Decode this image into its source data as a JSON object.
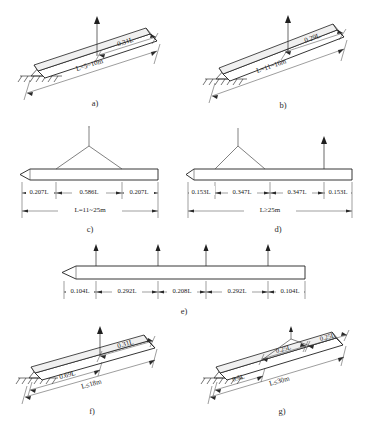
{
  "figure": {
    "caption_bottom": "",
    "panels": [
      {
        "id": "a",
        "label": "a)",
        "type": "inclined-single-point",
        "span_label": "L=5~10m",
        "segments": [
          "0.31L"
        ],
        "lift_points": 1,
        "ground_support": true,
        "sling": false
      },
      {
        "id": "b",
        "label": "b)",
        "type": "inclined-single-point",
        "span_label": "L=11~16m",
        "segments": [
          "0.29L"
        ],
        "lift_points": 1,
        "ground_support": true,
        "sling": false
      },
      {
        "id": "c",
        "label": "c)",
        "type": "horizontal-two-point-sling",
        "span_label": "L=11~25m",
        "segments": [
          "0.207L",
          "0.586L",
          "0.207L"
        ],
        "lift_points": 2,
        "ground_support": false,
        "sling": true
      },
      {
        "id": "d",
        "label": "d)",
        "type": "horizontal-three-point",
        "span_label": "L≥25m",
        "segments": [
          "0.153L",
          "0.347L",
          "0.347L",
          "0.153L"
        ],
        "lift_points": 3,
        "ground_support": false,
        "sling": true
      },
      {
        "id": "e",
        "label": "e)",
        "type": "horizontal-four-point",
        "span_label": "",
        "segments": [
          "0.104L",
          "0.292L",
          "0.208L",
          "0.292L",
          "0.104L"
        ],
        "lift_points": 4,
        "ground_support": false,
        "sling": false
      },
      {
        "id": "f",
        "label": "f)",
        "type": "inclined-single-point",
        "span_label": "L≤18m",
        "segments": [
          "0.69L",
          "0.31L"
        ],
        "lift_points": 1,
        "ground_support": true,
        "sling": false
      },
      {
        "id": "g",
        "label": "g)",
        "type": "inclined-two-point-sling",
        "span_label": "L≤30m",
        "segments": [
          "0.5L",
          "0.25L",
          "0.25L"
        ],
        "lift_points": 2,
        "ground_support": true,
        "sling": true
      }
    ],
    "colors": {
      "line": "#1f1f1f",
      "beam_face": "#ffffff",
      "beam_top": "#f0f0f0",
      "text": "#222222",
      "background": "#ffffff"
    }
  }
}
